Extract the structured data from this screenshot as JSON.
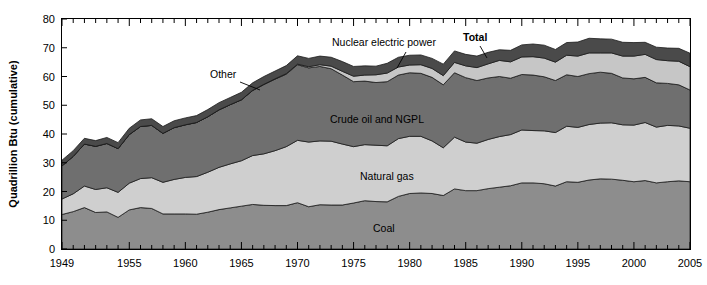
{
  "chart_data": {
    "type": "area",
    "stacked": true,
    "title": "",
    "xlabel": "",
    "ylabel": "Quadrillion Btu (cumulative)",
    "xlim": [
      1949,
      2005
    ],
    "ylim": [
      0,
      80
    ],
    "y_ticks": [
      0,
      10,
      20,
      30,
      40,
      50,
      60,
      70,
      80
    ],
    "x_ticks": [
      1949,
      1955,
      1960,
      1965,
      1970,
      1975,
      1980,
      1985,
      1990,
      1995,
      2000,
      2005
    ],
    "x_tick_labels": [
      "1949",
      "1955",
      "1960",
      "1965",
      "1970",
      "1975",
      "1980",
      "1985",
      "1990",
      "1995",
      "2000",
      "2005"
    ],
    "minor_ticks": true,
    "grid": false,
    "legend_position": "inline-annotations",
    "x": [
      1949,
      1950,
      1951,
      1952,
      1953,
      1954,
      1955,
      1956,
      1957,
      1958,
      1959,
      1960,
      1961,
      1962,
      1963,
      1964,
      1965,
      1966,
      1967,
      1968,
      1969,
      1970,
      1971,
      1972,
      1973,
      1974,
      1975,
      1976,
      1977,
      1978,
      1979,
      1980,
      1981,
      1982,
      1983,
      1984,
      1985,
      1986,
      1987,
      1988,
      1989,
      1990,
      1991,
      1992,
      1993,
      1994,
      1995,
      1996,
      1997,
      1998,
      1999,
      2000,
      2001,
      2002,
      2003,
      2004,
      2005
    ],
    "series": [
      {
        "name": "Coal",
        "color": "#8d8d8d",
        "label": "Coal",
        "values": [
          12.0,
          13.0,
          14.4,
          12.7,
          12.9,
          11.0,
          13.6,
          14.4,
          14.1,
          12.2,
          12.2,
          12.2,
          12.1,
          12.8,
          13.7,
          14.3,
          14.9,
          15.5,
          15.2,
          15.1,
          15.1,
          16.1,
          14.7,
          15.4,
          15.3,
          15.3,
          16.0,
          16.8,
          16.5,
          16.4,
          18.3,
          19.3,
          19.5,
          19.3,
          18.6,
          20.9,
          20.3,
          20.3,
          21.0,
          21.5,
          22.0,
          23.0,
          23.0,
          22.7,
          21.9,
          23.4,
          23.2,
          24.0,
          24.4,
          24.3,
          23.9,
          23.4,
          23.8,
          23.0,
          23.4,
          23.7,
          23.4
        ]
      },
      {
        "name": "Natural gas",
        "color": "#cfcfcf",
        "label": "Natural gas",
        "values": [
          5.4,
          6.2,
          7.5,
          8.0,
          8.4,
          8.7,
          9.3,
          10.1,
          10.7,
          11.0,
          12.0,
          12.7,
          13.1,
          13.9,
          14.7,
          15.3,
          15.8,
          17.0,
          17.9,
          19.1,
          20.5,
          21.7,
          22.5,
          22.2,
          22.2,
          21.2,
          19.6,
          19.5,
          19.6,
          19.5,
          20.1,
          19.9,
          19.7,
          18.3,
          16.6,
          18.0,
          16.9,
          16.5,
          17.1,
          17.6,
          17.8,
          18.4,
          18.2,
          18.4,
          18.6,
          19.3,
          19.1,
          19.3,
          19.4,
          19.6,
          19.3,
          19.7,
          20.2,
          19.4,
          19.6,
          19.1,
          18.6
        ]
      },
      {
        "name": "Crude oil and NGPL",
        "color": "#6f6f6f",
        "label": "Crude oil and NGPL",
        "values": [
          11.5,
          13.0,
          14.6,
          15.0,
          15.4,
          15.2,
          16.9,
          18.1,
          18.2,
          17.0,
          18.0,
          18.3,
          18.8,
          19.3,
          20.0,
          20.6,
          21.2,
          22.6,
          24.1,
          24.9,
          25.2,
          26.3,
          25.8,
          25.9,
          25.2,
          24.0,
          22.6,
          22.1,
          21.8,
          22.3,
          22.1,
          22.1,
          21.9,
          22.1,
          21.9,
          22.4,
          22.4,
          21.8,
          21.4,
          20.9,
          19.6,
          19.3,
          19.3,
          18.8,
          18.1,
          17.9,
          17.7,
          17.7,
          17.7,
          17.2,
          16.3,
          16.1,
          15.7,
          15.4,
          14.6,
          14.3,
          13.3
        ]
      },
      {
        "name": "Nuclear electric power",
        "color": "#c6c6c6",
        "label": "Nuclear electric power",
        "values": [
          0.0,
          0.0,
          0.0,
          0.0,
          0.0,
          0.0,
          0.0,
          0.0,
          0.0,
          0.0,
          0.0,
          0.0,
          0.0,
          0.0,
          0.0,
          0.0,
          0.0,
          0.1,
          0.1,
          0.1,
          0.2,
          0.2,
          0.4,
          0.6,
          0.9,
          1.3,
          1.9,
          2.1,
          2.7,
          3.0,
          2.8,
          2.7,
          3.0,
          3.1,
          3.2,
          3.6,
          4.1,
          4.5,
          4.9,
          5.6,
          5.7,
          6.1,
          6.4,
          6.5,
          6.4,
          6.8,
          7.1,
          7.2,
          6.7,
          7.1,
          7.6,
          7.9,
          8.0,
          8.1,
          7.9,
          8.2,
          8.1
        ]
      },
      {
        "name": "Other",
        "color": "#4a4a4a",
        "label": "Other",
        "values": [
          2.0,
          2.0,
          2.0,
          2.0,
          2.1,
          2.1,
          2.2,
          2.3,
          2.3,
          2.4,
          2.4,
          2.4,
          2.4,
          2.5,
          2.5,
          2.5,
          2.6,
          2.6,
          2.7,
          2.7,
          2.8,
          2.9,
          2.9,
          3.0,
          3.1,
          3.4,
          3.4,
          3.2,
          3.0,
          3.4,
          3.4,
          3.4,
          3.4,
          3.5,
          4.0,
          4.0,
          4.0,
          4.0,
          4.0,
          3.7,
          4.0,
          4.2,
          4.4,
          4.5,
          4.4,
          4.4,
          4.9,
          5.1,
          4.9,
          4.8,
          4.8,
          4.7,
          4.2,
          4.3,
          4.4,
          4.5,
          4.7
        ]
      }
    ],
    "annotations": [
      {
        "name": "other",
        "text": "Other",
        "x": 210,
        "y": 78
      },
      {
        "name": "nuclear-electric-power",
        "text": "Nuclear electric power",
        "x": 332,
        "y": 46
      },
      {
        "name": "total",
        "text": "Total",
        "x": 463,
        "y": 41
      },
      {
        "name": "crude-oil-and-ngpl",
        "text": "Crude oil and NGPL",
        "x": 330,
        "y": 123
      },
      {
        "name": "natural-gas",
        "text": "Natural gas",
        "x": 360,
        "y": 180
      },
      {
        "name": "coal",
        "text": "Coal",
        "x": 373,
        "y": 232
      }
    ],
    "leader_lines": [
      {
        "name": "other-leader",
        "points": "240,82 260,90"
      },
      {
        "name": "nuclear-leader",
        "points": "406,52 397,68"
      },
      {
        "name": "total-leader",
        "points": "480,46 487,58"
      }
    ]
  }
}
